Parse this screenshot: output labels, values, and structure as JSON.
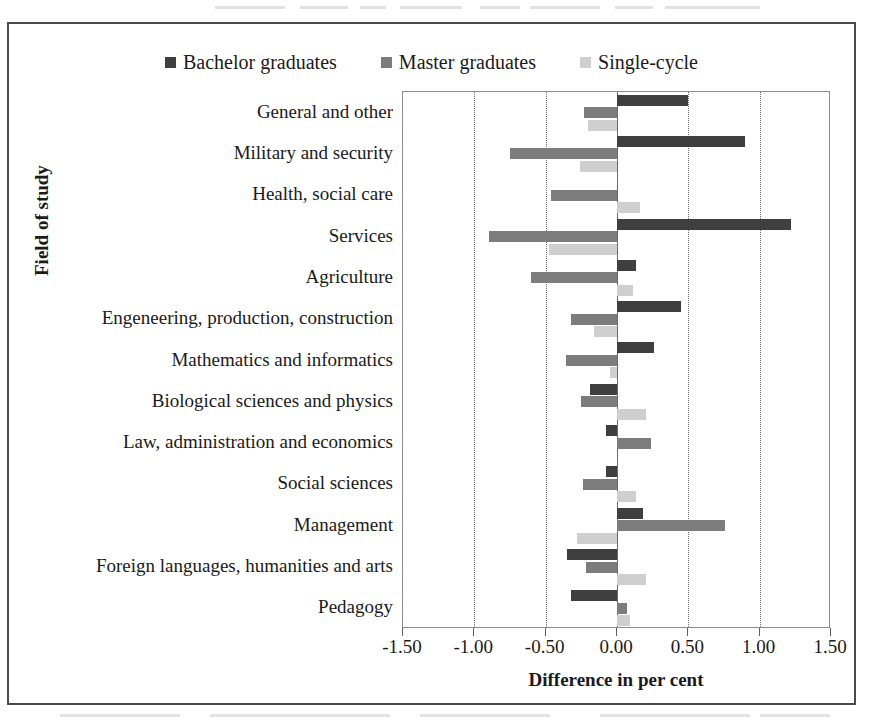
{
  "figure": {
    "y_axis_title": "Field of study",
    "x_axis_title": "Difference in per cent"
  },
  "legend": {
    "position": "top-center",
    "items": [
      {
        "label": "Bachelor graduates",
        "color": "#3f3f3f"
      },
      {
        "label": "Master graduates",
        "color": "#7c7c7c"
      },
      {
        "label": "Single-cycle",
        "color": "#cfcfcf"
      }
    ]
  },
  "colors": {
    "bachelor": "#3f3f3f",
    "master": "#7c7c7c",
    "single_cycle": "#cfcfcf",
    "frame": "#4a4a4a",
    "gridline": "#6e6e6e",
    "axis": "#5d5d5d"
  },
  "chart_data": {
    "type": "bar",
    "orientation": "horizontal",
    "title": "",
    "xlabel": "Difference in per cent",
    "ylabel": "Field of study",
    "xlim": [
      -1.5,
      1.5
    ],
    "xticks": [
      -1.5,
      -1.0,
      -0.5,
      0.0,
      0.5,
      1.0,
      1.5
    ],
    "xtick_labels": [
      "-1.50",
      "-1.00",
      "-0.50",
      "0.00",
      "0.50",
      "1.00",
      "1.50"
    ],
    "grid": true,
    "legend_position": "top-center",
    "categories": [
      "General and other",
      "Military and security",
      "Health, social care",
      "Services",
      "Agriculture",
      "Engeneering, production, construction",
      "Mathematics and informatics",
      "Biological sciences and physics",
      "Law, administration and economics",
      "Social sciences",
      "Management",
      "Foreign languages, humanities and arts",
      "Pedagogy"
    ],
    "series": [
      {
        "name": "Bachelor graduates",
        "color": "#3f3f3f",
        "values": [
          0.5,
          0.9,
          0.0,
          1.22,
          0.13,
          0.45,
          0.26,
          -0.19,
          -0.08,
          -0.08,
          0.18,
          -0.35,
          -0.32
        ]
      },
      {
        "name": "Master graduates",
        "color": "#7c7c7c",
        "values": [
          -0.23,
          -0.75,
          -0.46,
          -0.9,
          -0.6,
          -0.32,
          -0.36,
          -0.25,
          0.24,
          -0.24,
          0.76,
          -0.22,
          0.07
        ]
      },
      {
        "name": "Single-cycle",
        "color": "#cfcfcf",
        "values": [
          -0.2,
          -0.26,
          0.16,
          -0.48,
          0.11,
          -0.16,
          -0.05,
          0.2,
          0.0,
          0.13,
          -0.28,
          0.2,
          0.09
        ]
      }
    ]
  }
}
